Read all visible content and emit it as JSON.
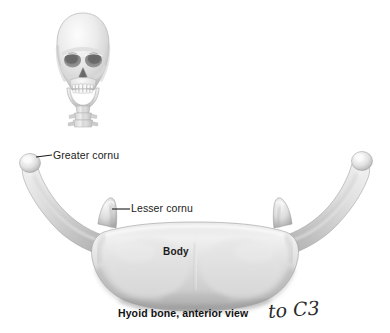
{
  "figure": {
    "title": "Hyoid bone, anterior view",
    "background_color": "#ffffff",
    "bone_color_light": "#f2f2f2",
    "bone_color_mid": "#d8d8d8",
    "bone_color_shadow": "#9a9a9a",
    "leader_line_color": "#1a1a1a",
    "text_color": "#1a1a1a"
  },
  "labels": {
    "greater_cornu": "Greater cornu",
    "lesser_cornu": "Lesser cornu",
    "body": "Body"
  },
  "caption": {
    "text": "Hyoid bone, anterior view"
  },
  "annotation": {
    "handwritten_note": "to C3"
  },
  "inset": {
    "name": "skull-anterior-view"
  }
}
